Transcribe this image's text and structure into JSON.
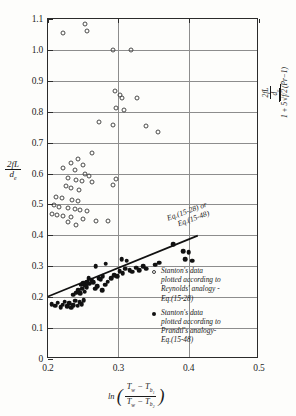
{
  "chart_data": {
    "type": "scatter",
    "title": "",
    "xlabel": "ln((Tw - Tb1)/(Tw - Tb2))",
    "ylabel": "2fL/de",
    "ylabel_right": "2fL/de / (1 + 5*sqrt(f/2)*(Pr-1))",
    "xlim": [
      0.2,
      0.5
    ],
    "ylim": [
      0.0,
      1.1
    ],
    "xticks": [
      0.2,
      0.3,
      0.4,
      0.5
    ],
    "xtick_labels": [
      "0.2",
      "0.3",
      "0.4",
      "0.5"
    ],
    "yticks": [
      0.0,
      0.1,
      0.2,
      0.3,
      0.4,
      0.5,
      0.6,
      0.7,
      0.8,
      0.9,
      1.0,
      1.1
    ],
    "ytick_labels": [
      "0",
      "0.1",
      "0.2",
      "0.3",
      "0.4",
      "0.5",
      "0.6",
      "0.7",
      "0.8",
      "0.9",
      "1.0",
      "1.1"
    ],
    "grid": true,
    "legend_position": "inside-lower-right",
    "annotations": [
      {
        "text_line1": "Eq.(15-28) or",
        "text_line2": "Eq.(15-48)",
        "x": 0.355,
        "y": 0.455,
        "rotation_deg": -20
      }
    ],
    "series": [
      {
        "name": "Stanton's data plotted according to Reynolds' analogy - Eq.(15-28)",
        "marker": "open-circle",
        "points": [
          [
            0.222,
            1.055
          ],
          [
            0.253,
            1.085
          ],
          [
            0.256,
            1.062
          ],
          [
            0.292,
            1.0
          ],
          [
            0.318,
            1.0
          ],
          [
            0.295,
            0.868
          ],
          [
            0.302,
            0.855
          ],
          [
            0.305,
            0.843
          ],
          [
            0.327,
            0.845
          ],
          [
            0.297,
            0.812
          ],
          [
            0.308,
            0.805
          ],
          [
            0.272,
            0.768
          ],
          [
            0.293,
            0.757
          ],
          [
            0.339,
            0.753
          ],
          [
            0.357,
            0.735
          ],
          [
            0.262,
            0.665
          ],
          [
            0.243,
            0.648
          ],
          [
            0.232,
            0.635
          ],
          [
            0.25,
            0.628
          ],
          [
            0.222,
            0.617
          ],
          [
            0.238,
            0.61
          ],
          [
            0.253,
            0.6
          ],
          [
            0.258,
            0.592
          ],
          [
            0.297,
            0.582
          ],
          [
            0.292,
            0.562
          ],
          [
            0.228,
            0.585
          ],
          [
            0.24,
            0.578
          ],
          [
            0.248,
            0.575
          ],
          [
            0.262,
            0.572
          ],
          [
            0.225,
            0.56
          ],
          [
            0.232,
            0.552
          ],
          [
            0.244,
            0.548
          ],
          [
            0.212,
            0.525
          ],
          [
            0.22,
            0.52
          ],
          [
            0.234,
            0.515
          ],
          [
            0.242,
            0.512
          ],
          [
            0.208,
            0.498
          ],
          [
            0.216,
            0.492
          ],
          [
            0.228,
            0.488
          ],
          [
            0.238,
            0.485
          ],
          [
            0.246,
            0.482
          ],
          [
            0.255,
            0.478
          ],
          [
            0.205,
            0.47
          ],
          [
            0.213,
            0.466
          ],
          [
            0.222,
            0.462
          ],
          [
            0.233,
            0.458
          ],
          [
            0.25,
            0.452
          ],
          [
            0.268,
            0.448
          ],
          [
            0.285,
            0.447
          ],
          [
            0.24,
            0.432
          ],
          [
            0.228,
            0.442
          ]
        ]
      },
      {
        "name": "Stanton's data plotted according to Prandtl's analogy - Eq.(15-48)",
        "marker": "filled-circle",
        "points": [
          [
            0.205,
            0.178
          ],
          [
            0.21,
            0.172
          ],
          [
            0.214,
            0.182
          ],
          [
            0.218,
            0.168
          ],
          [
            0.221,
            0.176
          ],
          [
            0.224,
            0.185
          ],
          [
            0.227,
            0.17
          ],
          [
            0.23,
            0.18
          ],
          [
            0.233,
            0.166
          ],
          [
            0.236,
            0.175
          ],
          [
            0.239,
            0.188
          ],
          [
            0.242,
            0.172
          ],
          [
            0.245,
            0.183
          ],
          [
            0.248,
            0.178
          ],
          [
            0.251,
            0.19
          ],
          [
            0.236,
            0.208
          ],
          [
            0.24,
            0.215
          ],
          [
            0.243,
            0.222
          ],
          [
            0.246,
            0.212
          ],
          [
            0.249,
            0.228
          ],
          [
            0.252,
            0.218
          ],
          [
            0.255,
            0.232
          ],
          [
            0.247,
            0.24
          ],
          [
            0.25,
            0.245
          ],
          [
            0.253,
            0.238
          ],
          [
            0.256,
            0.25
          ],
          [
            0.259,
            0.243
          ],
          [
            0.262,
            0.255
          ],
          [
            0.258,
            0.262
          ],
          [
            0.264,
            0.248
          ],
          [
            0.267,
            0.228
          ],
          [
            0.27,
            0.235
          ],
          [
            0.272,
            0.262
          ],
          [
            0.275,
            0.258
          ],
          [
            0.278,
            0.268
          ],
          [
            0.268,
            0.3
          ],
          [
            0.282,
            0.308
          ],
          [
            0.277,
            0.222
          ],
          [
            0.281,
            0.24
          ],
          [
            0.285,
            0.25
          ],
          [
            0.29,
            0.262
          ],
          [
            0.294,
            0.272
          ],
          [
            0.298,
            0.268
          ],
          [
            0.302,
            0.285
          ],
          [
            0.306,
            0.278
          ],
          [
            0.31,
            0.292
          ],
          [
            0.305,
            0.322
          ],
          [
            0.312,
            0.318
          ],
          [
            0.316,
            0.288
          ],
          [
            0.32,
            0.282
          ],
          [
            0.325,
            0.295
          ],
          [
            0.33,
            0.288
          ],
          [
            0.335,
            0.3
          ],
          [
            0.34,
            0.292
          ],
          [
            0.352,
            0.305
          ],
          [
            0.358,
            0.312
          ],
          [
            0.378,
            0.372
          ],
          [
            0.392,
            0.348
          ],
          [
            0.4,
            0.345
          ],
          [
            0.395,
            0.322
          ],
          [
            0.405,
            0.318
          ]
        ]
      }
    ],
    "fit_line": {
      "label": "Eq.(15-28) or Eq.(15-48)",
      "x_start": 0.2,
      "y_start": 0.197,
      "x_end": 0.415,
      "y_end": 0.395
    }
  },
  "axes": {
    "y_left": {
      "numerator": "2fL",
      "denominator": "de"
    },
    "y_right": {
      "numerator_top": "2fL",
      "numerator_bottom": "de",
      "denominator": "1 + 5",
      "sqrt_inner": "f/2",
      "tail": "(Pr-1)"
    },
    "x": {
      "ln": "ln",
      "num_a": "T",
      "num_a_sub": "w",
      "num_b": "T",
      "num_b_sub": "b1",
      "den_a": "T",
      "den_a_sub": "w",
      "den_b": "T",
      "den_b_sub": "b2",
      "minus": "−"
    }
  },
  "legend": {
    "entries": [
      {
        "marker": "open-circle",
        "line1": "Stanton's data",
        "line2": "plotted according to",
        "line3": "Reynolds' analogy -",
        "line4": "Eq.(15-28)"
      },
      {
        "marker": "filled-circle",
        "line1": "Stanton's data",
        "line2": "plotted according to",
        "line3": "Prandtl's analogy-",
        "line4": "Eq.(15-48)"
      }
    ]
  },
  "annotation": {
    "line1": "Eq.(15-28) or",
    "line2": "Eq.(15-48)"
  }
}
